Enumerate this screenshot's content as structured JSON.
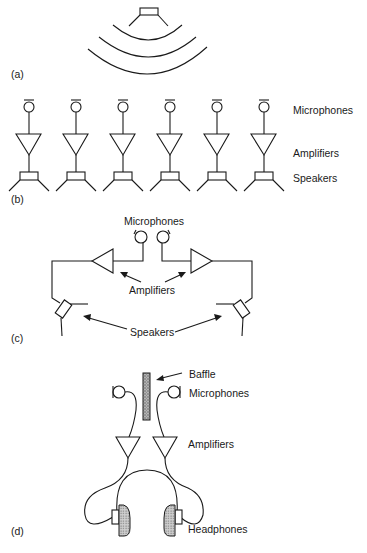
{
  "figure": {
    "panels": [
      {
        "id": "a",
        "label": "(a)"
      },
      {
        "id": "b",
        "label": "(b)",
        "labels": {
          "microphones": "Microphones",
          "amplifiers": "Amplifiers",
          "speakers": "Speakers"
        },
        "channel_count": 6
      },
      {
        "id": "c",
        "label": "(c)",
        "labels": {
          "microphones": "Microphones",
          "amplifiers": "Amplifiers",
          "speakers": "Speakers"
        }
      },
      {
        "id": "d",
        "label": "(d)",
        "labels": {
          "baffle": "Baffle",
          "microphones": "Microphones",
          "amplifiers": "Amplifiers",
          "headphones": "Headphones"
        }
      }
    ]
  },
  "icons": {
    "speaker": "speaker-icon",
    "microphone": "microphone-icon",
    "amplifier": "amplifier-triangle-icon",
    "sound-wave": "sound-wave-icon",
    "baffle": "baffle-icon",
    "headphones": "headphones-icon",
    "arrow": "arrow-icon"
  },
  "colors": {
    "stroke": "#1a1a1a",
    "background": "#ffffff",
    "baffle_fill": "#8a8a8a"
  }
}
